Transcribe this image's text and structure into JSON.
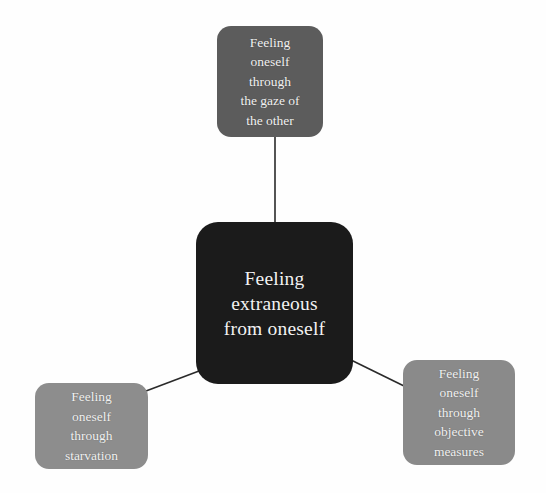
{
  "diagram": {
    "type": "concept-map",
    "background_color": "#fefefe",
    "center": {
      "id": "center",
      "label": "Feeling\nextraneous\nfrom oneself",
      "fill_color": "#1b1b1b",
      "text_color": "#f2f2f2"
    },
    "nodes": [
      {
        "id": "top",
        "label": "Feeling\noneself\nthrough\nthe gaze of\nthe other",
        "fill_color": "#5c5c5c",
        "text_color": "#f2f2f2",
        "position": "top"
      },
      {
        "id": "bottom-left",
        "label": "Feeling\noneself\nthrough\nstarvation",
        "fill_color": "#8d8d8d",
        "text_color": "#f2f2f2",
        "position": "bottom-left"
      },
      {
        "id": "bottom-right",
        "label": "Feeling\noneself\nthrough\nobjective\nmeasures",
        "fill_color": "#8a8a8a",
        "text_color": "#f2f2f2",
        "position": "bottom-right"
      }
    ],
    "connectors": [
      {
        "id": "center-to-top",
        "from": "center",
        "to": "top",
        "color": "#2a2a2a"
      },
      {
        "id": "center-to-bottom-left",
        "from": "center",
        "to": "bottom-left",
        "color": "#2a2a2a"
      },
      {
        "id": "center-to-bottom-right",
        "from": "center",
        "to": "bottom-right",
        "color": "#2a2a2a"
      }
    ]
  }
}
